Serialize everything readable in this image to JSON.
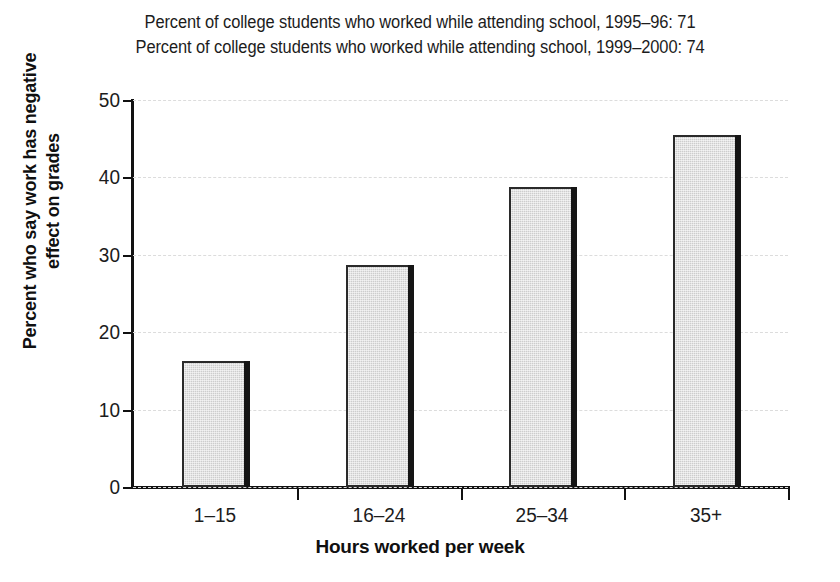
{
  "chart_data": {
    "type": "bar",
    "title": "Percent of college students who worked while attending school, 1995–96: 71",
    "subtitle": "Percent of college students who worked while attending school, 1999–2000: 74",
    "title_lines": [
      "Percent of college students who worked while attending school, 1995–96: 71",
      "Percent of college students who worked while attending school, 1999–2000: 74"
    ],
    "categories": [
      "1–15",
      "16–24",
      "25–34",
      "35+"
    ],
    "values": [
      16.3,
      28.7,
      38.7,
      45.5
    ],
    "xlabel": "Hours worked per week",
    "ylabel": "Percent who say work has negative effect on grades",
    "ylabel_lines": [
      "Percent who say work has negative",
      "effect on grades"
    ],
    "ylim": [
      0,
      50
    ],
    "ytick_labels": [
      "0",
      "10",
      "20",
      "30",
      "40",
      "50"
    ],
    "ytick_values": [
      0,
      10,
      20,
      30,
      40,
      50
    ],
    "grid": true,
    "grid_axis": "y",
    "legend": false,
    "bar_color": "#cdcdcd",
    "bar_edge_color": "#2a2a2a",
    "bar_shadow_color": "#151515",
    "gridline_color": "#dcdcdc",
    "axis_color": "#111111",
    "background_color": "#ffffff"
  }
}
